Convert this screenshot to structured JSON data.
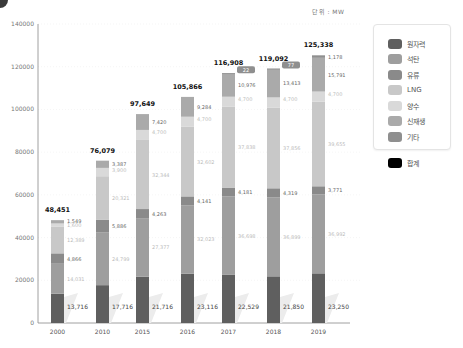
{
  "unit_label": "단위 : MW",
  "legend": {
    "items": [
      {
        "label": "원자력",
        "color": "#5f5f5f"
      },
      {
        "label": "석탄",
        "color": "#9e9e9e"
      },
      {
        "label": "유류",
        "color": "#8a8a8a"
      },
      {
        "label": "LNG",
        "color": "#c8c8c8"
      },
      {
        "label": "양수",
        "color": "#d9d9d9"
      },
      {
        "label": "신재생",
        "color": "#aaaaaa"
      },
      {
        "label": "기타",
        "color": "#8f8f8f"
      }
    ],
    "total": {
      "label": "합계",
      "color": "#000000"
    }
  },
  "chart_data": {
    "type": "bar",
    "stacked": true,
    "title": "",
    "unit": "MW",
    "xlabel": "",
    "ylabel": "",
    "ylim": [
      0,
      140000
    ],
    "yticks": [
      0,
      20000,
      40000,
      60000,
      80000,
      100000,
      120000,
      140000
    ],
    "grid": true,
    "legend_position": "right",
    "categories": [
      "2000",
      "2010",
      "2015",
      "2016",
      "2017",
      "2018",
      "2019"
    ],
    "series": [
      {
        "name": "원자력",
        "values": [
          13716,
          17716,
          21716,
          23116,
          22529,
          21850,
          23250
        ],
        "labels": [
          "13,716",
          "17,716",
          "21,716",
          "23,116",
          "22,529",
          "21,850",
          "23,250"
        ]
      },
      {
        "name": "석탄",
        "values": [
          14031,
          24799,
          27377,
          32023,
          36698,
          36899,
          36992
        ],
        "labels": [
          "14,031",
          "24,799",
          "27,377",
          "32,023",
          "36,698",
          "36,899",
          "36,992"
        ]
      },
      {
        "name": "유류",
        "values": [
          4866,
          5886,
          4263,
          4141,
          4181,
          4319,
          3771
        ],
        "labels": [
          "4,866",
          "5,886",
          "4,263",
          "4,141",
          "4,181",
          "4,319",
          "3,771"
        ]
      },
      {
        "name": "LNG",
        "values": [
          12389,
          20321,
          32344,
          32602,
          37838,
          37856,
          39655
        ],
        "labels": [
          "12,389",
          "20,321",
          "32,344",
          "32,602",
          "37,838",
          "37,856",
          "39,655"
        ]
      },
      {
        "name": "양수",
        "values": [
          1600,
          3900,
          4700,
          4700,
          4700,
          4700,
          4700
        ],
        "labels": [
          "1,600",
          "3,900",
          "4,700",
          "4,700",
          "4,700",
          "4,700",
          "4,700"
        ]
      },
      {
        "name": "신재생",
        "values": [
          1549,
          3387,
          7420,
          9284,
          10976,
          13413,
          15791
        ],
        "labels": [
          "1,549",
          "3,387",
          "7,420",
          "9,284",
          "10,976",
          "13,413",
          "15,791"
        ]
      },
      {
        "name": "기타",
        "values": [
          0,
          0,
          0,
          0,
          22,
          77,
          1178
        ],
        "labels": [
          "",
          "",
          "",
          "",
          "22",
          "77",
          "1,178"
        ]
      }
    ],
    "totals": [
      48451,
      76079,
      97649,
      105866,
      116908,
      119092,
      125338
    ],
    "total_labels": [
      "48,451",
      "76,079",
      "97,649",
      "105,866",
      "116,908",
      "119,092",
      "125,338"
    ]
  }
}
